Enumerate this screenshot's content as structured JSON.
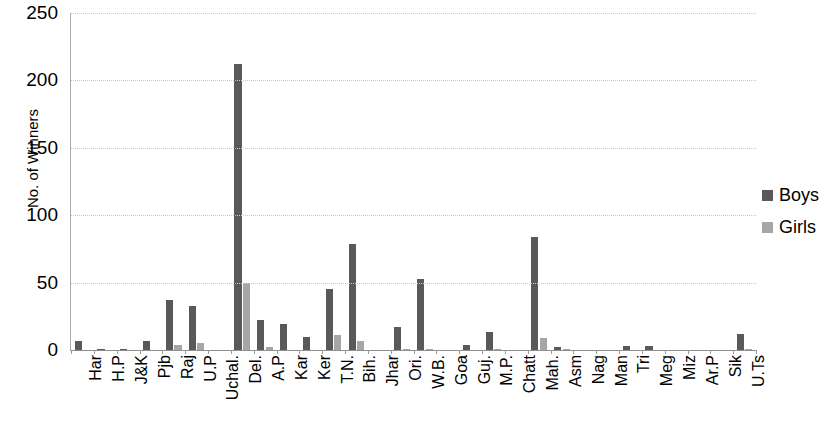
{
  "chart_data": {
    "type": "bar",
    "title": "",
    "xlabel": "",
    "ylabel": "No. of Winners",
    "ylim": [
      0,
      250
    ],
    "ytick_labels": [
      "0",
      "50",
      "100",
      "150",
      "200",
      "250"
    ],
    "yticks": [
      0,
      50,
      100,
      150,
      200,
      250
    ],
    "grid": true,
    "legend_position": "right",
    "categories": [
      "Har",
      "H.P",
      "J&K",
      "Pjb",
      "Raj",
      "U.P",
      "Uchal.",
      "Del.",
      "A.P",
      "Kar",
      "Ker",
      "T.N.",
      "Bih.",
      "Jhar",
      "Ori.",
      "W.B.",
      "Goa",
      "Guj.",
      "M.P.",
      "Chatt",
      "Mah.",
      "Asm",
      "Nag",
      "Man",
      "Tri",
      "Meg",
      "Miz",
      "Ar.P",
      "Sik",
      "U.Ts"
    ],
    "series": [
      {
        "name": "Boys",
        "color": "#595959",
        "values": [
          7,
          1,
          1,
          7,
          37,
          33,
          0,
          212,
          22,
          19,
          10,
          45,
          79,
          0,
          17,
          53,
          0,
          4,
          13,
          0,
          84,
          2,
          0,
          0,
          3,
          3,
          0,
          0,
          0,
          12
        ]
      },
      {
        "name": "Girls",
        "color": "#a6a6a6",
        "values": [
          0,
          0,
          0,
          0,
          4,
          5,
          0,
          50,
          2,
          0,
          0,
          11,
          7,
          0,
          1,
          1,
          0,
          0,
          1,
          0,
          9,
          1,
          0,
          0,
          0,
          0,
          0,
          0,
          0,
          1
        ]
      }
    ]
  },
  "legend": {
    "items": [
      {
        "label": "Boys",
        "color": "#595959"
      },
      {
        "label": "Girls",
        "color": "#a6a6a6"
      }
    ]
  }
}
